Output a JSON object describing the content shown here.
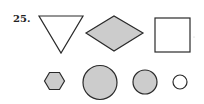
{
  "question": {
    "number": "25."
  },
  "colors": {
    "stroke": "#2a2a2a",
    "fill_gray": "#cccccc",
    "fill_white": "#ffffff"
  },
  "shapes": {
    "row1": [
      {
        "type": "triangle-down",
        "fill": "white"
      },
      {
        "type": "diamond",
        "fill": "gray"
      },
      {
        "type": "square",
        "fill": "white"
      }
    ],
    "row2": [
      {
        "type": "hexagon",
        "fill": "gray"
      },
      {
        "type": "circle-large",
        "fill": "gray"
      },
      {
        "type": "circle-medium",
        "fill": "gray"
      },
      {
        "type": "circle-small",
        "fill": "white"
      }
    ]
  }
}
